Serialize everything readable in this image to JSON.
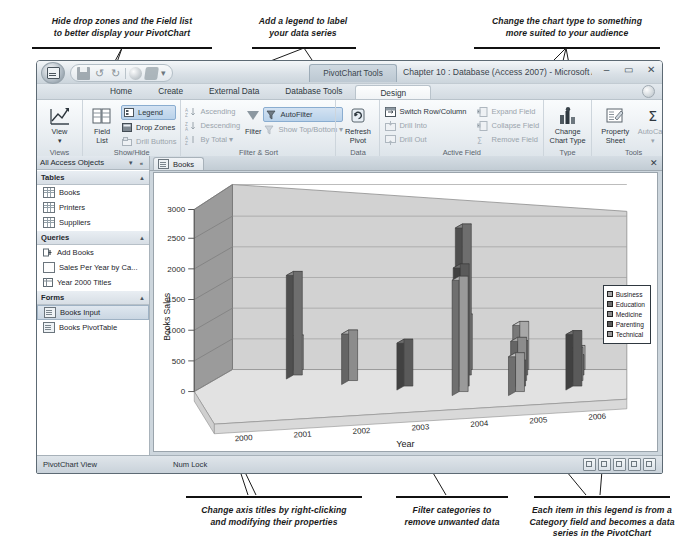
{
  "callouts": {
    "top_left": "Hide drop zones and the Field list\nto better display your PivotChart",
    "top_mid": "Add a legend to label\nyour data series",
    "top_right": "Change the chart type to something\nmore suited to your audience",
    "bottom_left": "Change axis titles by right-clicking\nand modifying their properties",
    "bottom_mid": "Filter categories to\nremove unwanted data",
    "bottom_right": "Each item in this legend is from a\nCategory field and becomes a data\nseries in the PivotChart"
  },
  "window": {
    "title": "Chapter 10 : Database (Access 2007) - Microsoft Access",
    "contextual_tab": "PivotChart Tools",
    "minimize": "–",
    "maximize": "▭",
    "close": "✕",
    "quick_access": [
      "save-icon",
      "undo-icon",
      "redo-icon",
      "globe-icon",
      "paint-icon",
      "customize-icon"
    ]
  },
  "ribbon": {
    "tabs": [
      {
        "label": "Home",
        "active": false
      },
      {
        "label": "Create",
        "active": false
      },
      {
        "label": "External Data",
        "active": false
      },
      {
        "label": "Database Tools",
        "active": false
      },
      {
        "label": "Design",
        "active": true
      }
    ],
    "groups": [
      {
        "name": "View",
        "label": "Views",
        "big_buttons": [
          {
            "label": "View",
            "sublabel": "▾",
            "icon": "pivotchart-view-icon"
          }
        ],
        "small_buttons": []
      },
      {
        "name": "ShowHide",
        "label": "Show/Hide",
        "big_buttons": [
          {
            "label": "Field\nList",
            "sublabel": "",
            "icon": "field-list-icon"
          }
        ],
        "small_buttons": [
          {
            "label": "Legend",
            "icon": "legend-icon",
            "state": "pressed",
            "enabled": true
          },
          {
            "label": "Drop Zones",
            "icon": "drop-zones-icon",
            "state": "normal",
            "enabled": true
          },
          {
            "label": "Drill Buttons",
            "icon": "drill-buttons-icon",
            "state": "normal",
            "enabled": false
          }
        ]
      },
      {
        "name": "FilterSort",
        "label": "Filter & Sort",
        "big_buttons": [
          {
            "label": "Filter",
            "sublabel": "",
            "icon": "funnel-icon"
          }
        ],
        "small_buttons": [
          {
            "label": "Ascending",
            "icon": "sort-ascending-icon",
            "state": "normal",
            "enabled": false
          },
          {
            "label": "Descending",
            "icon": "sort-descending-icon",
            "state": "normal",
            "enabled": false
          },
          {
            "label": "By Total ▾",
            "icon": "sort-by-total-icon",
            "state": "normal",
            "enabled": false
          },
          {
            "label": "AutoFilter",
            "icon": "autofilter-icon",
            "state": "pressed",
            "enabled": true
          },
          {
            "label": "Show Top/Bottom ▾",
            "icon": "show-top-bottom-icon",
            "state": "normal",
            "enabled": false
          }
        ]
      },
      {
        "name": "Data",
        "label": "Data",
        "big_buttons": [
          {
            "label": "Refresh\nPivot",
            "sublabel": "",
            "icon": "refresh-icon"
          }
        ],
        "small_buttons": []
      },
      {
        "name": "ActiveField",
        "label": "Active Field",
        "big_buttons": [],
        "small_buttons": [
          {
            "label": "Switch Row/Column",
            "icon": "switch-row-column-icon",
            "state": "normal",
            "enabled": true
          },
          {
            "label": "Drill Into",
            "icon": "drill-into-icon",
            "state": "normal",
            "enabled": false
          },
          {
            "label": "Drill Out",
            "icon": "drill-out-icon",
            "state": "normal",
            "enabled": false
          },
          {
            "label": "Expand Field",
            "icon": "expand-field-icon",
            "state": "normal",
            "enabled": false
          },
          {
            "label": "Collapse Field",
            "icon": "collapse-field-icon",
            "state": "normal",
            "enabled": false
          },
          {
            "label": "Remove Field",
            "icon": "remove-field-icon",
            "state": "normal",
            "enabled": false
          }
        ]
      },
      {
        "name": "Type",
        "label": "Type",
        "big_buttons": [
          {
            "label": "Change\nChart Type",
            "sublabel": "",
            "icon": "change-chart-type-icon"
          }
        ],
        "small_buttons": []
      },
      {
        "name": "Tools",
        "label": "Tools",
        "big_buttons": [
          {
            "label": "Property\nSheet",
            "sublabel": "",
            "icon": "property-sheet-icon"
          },
          {
            "label": "AutoCalc\n▾",
            "sublabel": "",
            "icon": "autocalc-sigma-icon"
          }
        ],
        "small_buttons": []
      }
    ]
  },
  "navpane": {
    "title": "All Access Objects",
    "groups": [
      {
        "name": "Tables",
        "items": [
          {
            "label": "Books",
            "icon": "table-icon",
            "selected": false
          },
          {
            "label": "Printers",
            "icon": "table-icon",
            "selected": false
          },
          {
            "label": "Suppliers",
            "icon": "table-icon",
            "selected": false
          }
        ]
      },
      {
        "name": "Queries",
        "items": [
          {
            "label": "Add Books",
            "icon": "append-query-icon",
            "selected": false
          },
          {
            "label": "Sales Per Year by Ca...",
            "icon": "select-query-icon",
            "selected": false
          },
          {
            "label": "Year 2000 Titles",
            "icon": "crosstab-query-icon",
            "selected": false
          }
        ]
      },
      {
        "name": "Forms",
        "items": [
          {
            "label": "Books Input",
            "icon": "form-icon",
            "selected": true
          },
          {
            "label": "Books PivotTable",
            "icon": "form-icon",
            "selected": false
          }
        ]
      }
    ]
  },
  "document": {
    "tab_label": "Books",
    "tab_icon": "form-icon",
    "close_label": "✕"
  },
  "chart_data": {
    "type": "bar",
    "title": "",
    "xlabel": "Year",
    "ylabel": "Books Sales",
    "categories": [
      "2000",
      "2001",
      "2002",
      "2003",
      "2004",
      "2005",
      "2006"
    ],
    "ylim": [
      0,
      3000
    ],
    "yticks": [
      0,
      500,
      1000,
      1500,
      2000,
      2500,
      3000
    ],
    "grid": true,
    "legend_position": "right",
    "legend_title": "",
    "series": [
      {
        "name": "Business",
        "color": "#a8a8a8",
        "values": [
          0,
          560,
          0,
          0,
          900,
          780,
          390
        ]
      },
      {
        "name": "Education",
        "color": "#6e6e6e",
        "values": [
          0,
          1680,
          0,
          0,
          2450,
          560,
          330
        ]
      },
      {
        "name": "Medicine",
        "color": "#8c8c8c",
        "values": [
          0,
          0,
          820,
          0,
          0,
          700,
          540
        ]
      },
      {
        "name": "Parenting",
        "color": "#5a5a5a",
        "values": [
          0,
          0,
          0,
          760,
          1980,
          420,
          900
        ]
      },
      {
        "name": "Technical",
        "color": "#9a9a9a",
        "values": [
          0,
          0,
          0,
          0,
          1870,
          630,
          0
        ]
      }
    ]
  },
  "status": {
    "view_mode": "PivotChart View",
    "num_lock": "Num Lock",
    "view_buttons": [
      "datasheet-view-icon",
      "pivottable-view-icon",
      "pivotchart-view-icon",
      "design-view-icon",
      "layout-view-icon"
    ]
  }
}
